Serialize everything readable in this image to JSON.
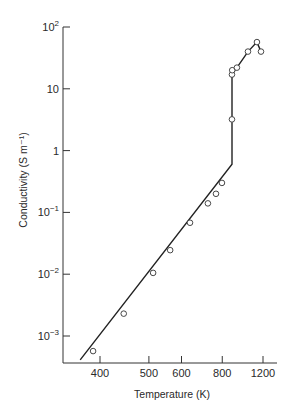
{
  "chart_data": {
    "type": "line",
    "title": "",
    "xlabel": "Temperature (K)",
    "ylabel": "Conductivity (S m⁻¹)",
    "x_scale": "reciprocal (1/T)",
    "y_scale": "log",
    "xlim": [
      360,
      1270
    ],
    "ylim": [
      0.0004,
      100
    ],
    "grid": false,
    "legend": null,
    "x_ticks": [
      {
        "value": 400,
        "label": "400"
      },
      {
        "value": 500,
        "label": "500"
      },
      {
        "value": 600,
        "label": "600"
      },
      {
        "value": 800,
        "label": "800"
      },
      {
        "value": 1200,
        "label": "1200"
      }
    ],
    "y_ticks": [
      {
        "value": 100,
        "base": "10",
        "exp": "2"
      },
      {
        "value": 10,
        "base": "10",
        "exp": ""
      },
      {
        "value": 1,
        "base": "1",
        "exp": ""
      },
      {
        "value": 0.1,
        "base": "10",
        "exp": "−1"
      },
      {
        "value": 0.01,
        "base": "10",
        "exp": "−2"
      },
      {
        "value": 0.001,
        "base": "10",
        "exp": "−3"
      }
    ],
    "series": [
      {
        "name": "fitted curve",
        "style": "line",
        "x": [
          370,
          869,
          869,
          909,
          1013,
          1117,
          1171
        ],
        "y": [
          0.00041,
          0.6,
          17,
          22,
          40,
          57,
          40
        ]
      },
      {
        "name": "measured",
        "style": "open-circles",
        "x": [
          389,
          443,
          511,
          561,
          633,
          716,
          761,
          798,
          869,
          869,
          871,
          909,
          1013,
          1117,
          1171
        ],
        "y": [
          0.00057,
          0.0023,
          0.0105,
          0.0245,
          0.068,
          0.14,
          0.2,
          0.3,
          3.2,
          17,
          20,
          22,
          40,
          57,
          40
        ]
      }
    ]
  }
}
